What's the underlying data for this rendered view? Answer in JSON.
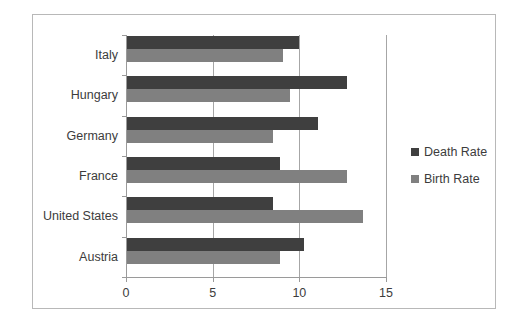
{
  "chart_data": {
    "type": "bar",
    "orientation": "horizontal",
    "title": "",
    "xlabel": "",
    "ylabel": "",
    "categories": [
      "Italy",
      "Hungary",
      "Germany",
      "France",
      "United States",
      "Austria"
    ],
    "series": [
      {
        "name": "Death Rate",
        "color": "#3f3f3f",
        "values": [
          9.9,
          12.7,
          11.0,
          8.8,
          8.4,
          10.2
        ]
      },
      {
        "name": "Birth Rate",
        "color": "#808080",
        "values": [
          9.0,
          9.4,
          8.4,
          12.7,
          13.6,
          8.8
        ]
      }
    ],
    "xlim": [
      0,
      15
    ],
    "xticks": [
      0,
      5,
      10,
      15
    ],
    "xtick_labels": [
      "0",
      "5",
      "10",
      "15"
    ],
    "grid": true,
    "grid_axis": "x",
    "legend_position": "right",
    "plot_border_color": "#b8b8b8",
    "axis_color": "#9a9a9a",
    "gridline_color": "#a6a6a6"
  }
}
